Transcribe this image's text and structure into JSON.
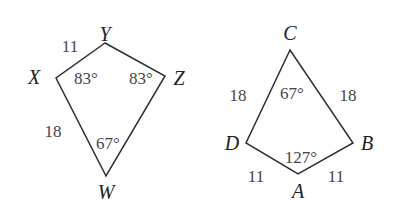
{
  "figure": {
    "background_color": "#ffffff",
    "stroke_color": "#2e2e32",
    "label_color": "#3a3a3e",
    "vertex_label_color": "#212125",
    "shapes": [
      {
        "name": "kite-xyzw",
        "vertex_labels": [
          "Y",
          "X",
          "W",
          "Z"
        ],
        "side_labels": [
          "11",
          "18"
        ],
        "angle_labels": [
          "83°",
          "83°",
          "67°"
        ]
      },
      {
        "name": "kite-abcd",
        "vertex_labels": [
          "C",
          "D",
          "A",
          "B"
        ],
        "side_labels": [
          "18",
          "18",
          "11",
          "11"
        ],
        "angle_labels": [
          "67°",
          "127°"
        ]
      }
    ],
    "left_kite": {
      "vertex_y": "Y",
      "vertex_x": "X",
      "vertex_z": "Z",
      "vertex_w": "W",
      "side_xy": "11",
      "side_xw": "18",
      "angle_x": "83°",
      "angle_z": "83°",
      "angle_w": "67°"
    },
    "right_kite": {
      "vertex_c": "C",
      "vertex_d": "D",
      "vertex_b": "B",
      "vertex_a": "A",
      "side_dc": "18",
      "side_cb": "18",
      "side_da": "11",
      "side_ab": "11",
      "angle_c": "67°",
      "angle_a": "127°"
    }
  }
}
